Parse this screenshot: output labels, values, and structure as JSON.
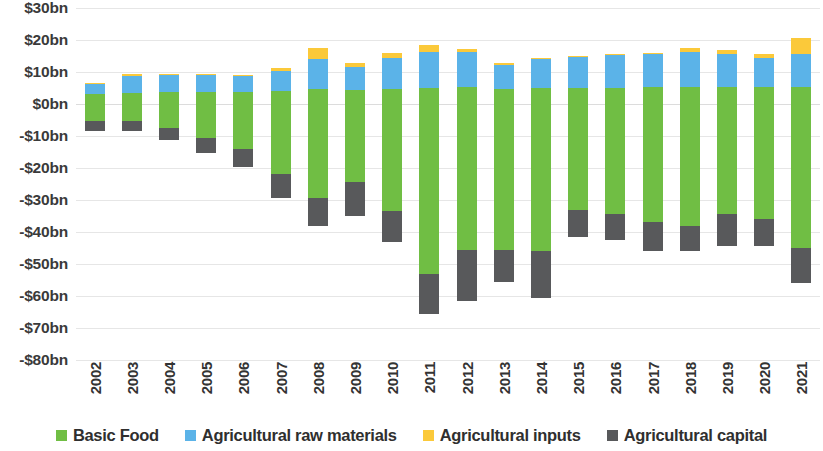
{
  "chart": {
    "type": "bar-stacked-diverging",
    "y_tick_labels": [
      "$30bn",
      "$20bn",
      "$10bn",
      "$0bn",
      "-$10bn",
      "-$20bn",
      "-$30bn",
      "-$40bn",
      "-$50bn",
      "-$60bn",
      "-$70bn",
      "-$80bn"
    ],
    "y_tick_values": [
      30,
      20,
      10,
      0,
      -10,
      -20,
      -30,
      -40,
      -50,
      -60,
      -70,
      -80
    ]
  },
  "legend": {
    "position": "bottom",
    "items": [
      {
        "label": "Basic Food",
        "color": "#70be44",
        "key": "basic_food"
      },
      {
        "label": "Agricultural raw materials",
        "color": "#5bb3e8",
        "key": "raw_materials"
      },
      {
        "label": "Agricultural inputs",
        "color": "#fbc93a",
        "key": "inputs"
      },
      {
        "label": "Agricultural capital",
        "color": "#58595b",
        "key": "capital"
      }
    ]
  },
  "chart_data": {
    "type": "bar",
    "title": "",
    "xlabel": "",
    "ylabel": "",
    "ylim": [
      -80,
      30
    ],
    "grid": true,
    "stacked": true,
    "units": "US$ billions",
    "categories": [
      "2002",
      "2003",
      "2004",
      "2005",
      "2006",
      "2007",
      "2008",
      "2009",
      "2010",
      "2011",
      "2012",
      "2013",
      "2014",
      "2015",
      "2016",
      "2017",
      "2018",
      "2019",
      "2020",
      "2021"
    ],
    "series": [
      {
        "name": "Basic Food",
        "color": "#70be44",
        "values_positive": [
          3.0,
          3.4,
          3.6,
          3.7,
          3.7,
          4.0,
          4.7,
          4.3,
          4.6,
          5.0,
          5.2,
          4.8,
          5.0,
          5.0,
          5.0,
          5.2,
          5.3,
          5.2,
          5.2,
          5.4
        ],
        "values_negative": [
          -5.3,
          -5.2,
          -7.5,
          -10.5,
          -14.0,
          -22.0,
          -29.5,
          -24.5,
          -33.5,
          -53.0,
          -45.5,
          -45.5,
          -46.0,
          -33.0,
          -34.5,
          -37.0,
          -38.0,
          -34.5,
          -36.0,
          -45.0
        ]
      },
      {
        "name": "Agricultural raw materials",
        "color": "#5bb3e8",
        "values": [
          3.3,
          5.2,
          5.4,
          5.5,
          5.3,
          6.4,
          9.5,
          7.4,
          9.8,
          11.4,
          11.0,
          7.3,
          9.2,
          9.9,
          10.3,
          10.6,
          11.0,
          10.4,
          9.3,
          10.3
        ]
      },
      {
        "name": "Agricultural inputs",
        "color": "#fbc93a",
        "values": [
          0.4,
          0.7,
          0.3,
          0.2,
          0.2,
          1.0,
          3.3,
          1.0,
          1.6,
          2.0,
          0.9,
          0.6,
          0.3,
          0.2,
          0.2,
          0.2,
          1.2,
          1.3,
          1.0,
          5.0
        ]
      },
      {
        "name": "Agricultural capital",
        "color": "#58595b",
        "values": [
          -3.2,
          -3.3,
          -3.8,
          -4.7,
          -5.8,
          -7.5,
          -8.5,
          -10.5,
          -9.5,
          -12.5,
          -16.0,
          -10.0,
          -14.5,
          -8.5,
          -8.0,
          -9.0,
          -8.0,
          -10.0,
          -8.5,
          -11.0
        ]
      }
    ]
  }
}
